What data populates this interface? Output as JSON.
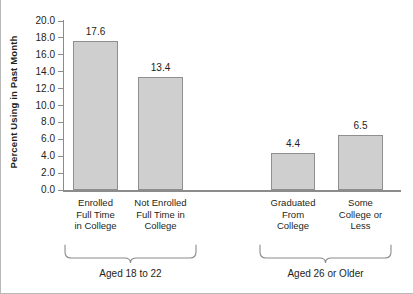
{
  "chart_data": {
    "type": "bar",
    "title": "",
    "xlabel": "",
    "ylabel": "Percent Using in Past Month",
    "ylim": [
      0.0,
      20.0
    ],
    "ytick_step": 2.0,
    "yticks": [
      "20.0",
      "18.0",
      "16.0",
      "14.0",
      "12.0",
      "10.0",
      "8.0",
      "6.0",
      "4.0",
      "2.0",
      "0.0"
    ],
    "grid": false,
    "legend": null,
    "categories": [
      "Enrolled Full Time in College",
      "Not Enrolled Full Time in College",
      "Graduated From College",
      "Some College or Less"
    ],
    "category_label_lines": [
      [
        "Enrolled",
        "Full Time",
        "in College"
      ],
      [
        "Not Enrolled",
        "Full Time in",
        "College"
      ],
      [
        "Graduated",
        "From",
        "College"
      ],
      [
        "Some",
        "College or",
        "Less"
      ]
    ],
    "values": [
      17.6,
      13.4,
      4.4,
      6.5
    ],
    "value_labels": [
      "17.6",
      "13.4",
      "4.4",
      "6.5"
    ],
    "groups": [
      {
        "label": "Aged 18 to 22",
        "categories": [
          0,
          1
        ]
      },
      {
        "label": "Aged 26 or Older",
        "categories": [
          2,
          3
        ]
      }
    ],
    "colors": {
      "bar_fill": "#cfcfcf",
      "bar_stroke": "#8f8f8f",
      "axis": "#8b8b8b",
      "text": "#231f20",
      "background": "#ffffff",
      "frame": "#b9b9b9"
    }
  }
}
